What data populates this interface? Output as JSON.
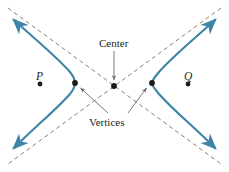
{
  "figure": {
    "type": "hyperbola-diagram",
    "width": 229,
    "height": 172,
    "background_color": "#ffffff",
    "curve_color": "#3d84a8",
    "asymptote_color": "#8a7f72",
    "point_color": "#1a1a1a",
    "leader_color": "#6b6b6b",
    "text_color": "#231f20"
  },
  "labels": {
    "center": "Center",
    "vertices": "Vertices",
    "point_p": "P",
    "point_q": "Q"
  },
  "geometry": {
    "center": {
      "x": 114,
      "y": 86
    },
    "vertices": [
      {
        "x": 75,
        "y": 83
      },
      {
        "x": 152,
        "y": 83
      }
    ],
    "foci_points": [
      {
        "name": "P",
        "x": 40,
        "y": 84
      },
      {
        "name": "Q",
        "x": 188,
        "y": 84
      }
    ],
    "asymptotes": [
      {
        "from": {
          "x": 8,
          "y": 8
        },
        "to": {
          "x": 221,
          "y": 164
        }
      },
      {
        "from": {
          "x": 221,
          "y": 8
        },
        "to": {
          "x": 8,
          "y": 164
        }
      }
    ],
    "arrow_tips": [
      {
        "x": 12,
        "y": 18
      },
      {
        "x": 217,
        "y": 18
      },
      {
        "x": 12,
        "y": 155
      },
      {
        "x": 217,
        "y": 155
      }
    ],
    "leaders": {
      "center": {
        "from": {
          "x": 114,
          "y": 51
        },
        "to": {
          "x": 114,
          "y": 80
        }
      },
      "vertices_left": {
        "from": {
          "x": 108,
          "y": 113
        },
        "to": {
          "x": 79,
          "y": 87
        }
      },
      "vertices_right": {
        "from": {
          "x": 128,
          "y": 113
        },
        "to": {
          "x": 148,
          "y": 87
        }
      }
    }
  }
}
